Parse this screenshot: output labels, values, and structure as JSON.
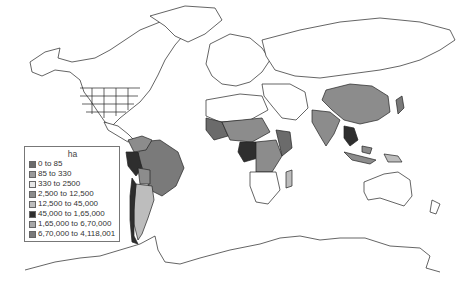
{
  "legend": {
    "title": "ha",
    "items": [
      {
        "label": "0 to 85",
        "color": "#6b6b6b"
      },
      {
        "label": "85 to 330",
        "color": "#9a9a9a"
      },
      {
        "label": "330 to 2500",
        "color": "#e6e6e6"
      },
      {
        "label": "2,500 to 12,500",
        "color": "#8c8c8c"
      },
      {
        "label": "12,500 to 45,000",
        "color": "#bdbdbd"
      },
      {
        "label": "45,000 to 1,65,000",
        "color": "#2e2e2e"
      },
      {
        "label": "1,65,000 to 6,70,000",
        "color": "#a8a8a8"
      },
      {
        "label": "6,70,000 to 4,118,001",
        "color": "#7a7a7a"
      }
    ]
  },
  "colors": {
    "land_default": "#ffffff",
    "outline": "#222222",
    "background": "#ffffff"
  }
}
